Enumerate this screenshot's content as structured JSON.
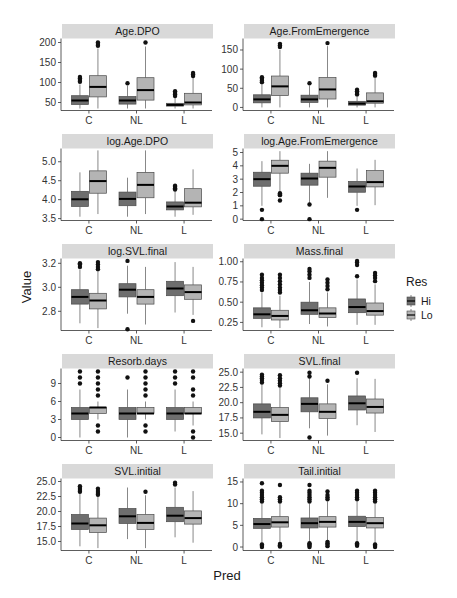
{
  "colors": {
    "hi_fill": "#6e6e6e",
    "lo_fill": "#b4b4b4",
    "box_stroke": "#4a4a4a",
    "median": "#000000",
    "whisker": "#6a6a6a",
    "outlier": "#111111",
    "strip_bg": "#d9d9d9",
    "axis": "#333333"
  },
  "chart_data": {
    "type": "boxplot",
    "layout": "facet_wrap 5 rows x 2 cols, free y scales",
    "xlabel": "Pred",
    "ylabel": "Value",
    "categories": [
      "C",
      "NL",
      "L"
    ],
    "legend": {
      "title": "Res",
      "entries": [
        "Hi",
        "Lo"
      ],
      "position": "right"
    },
    "panels": [
      {
        "title": "Age.DPO",
        "ylim": [
          30,
          210
        ],
        "yticks": [
          50,
          100,
          150,
          200
        ],
        "boxes": {
          "C": {
            "Hi": [
              35,
              45,
              55,
              67,
              95,
              [
                102,
                106,
                110,
                114
              ]
            ],
            "Lo": [
              35,
              64,
              89,
              117,
              185,
              [
                192,
                196,
                200
              ]
            ]
          },
          "NL": {
            "Hi": [
              35,
              46,
              55,
              65,
              92,
              [
                98
              ]
            ],
            "Lo": [
              35,
              56,
              81,
              112,
              190,
              [
                200
              ]
            ]
          },
          "L": {
            "Hi": [
              35,
              41,
              44,
              48,
              62,
              [
                66,
                70,
                74,
                78
              ]
            ],
            "Lo": [
              35,
              44,
              50,
              73,
              112,
              [
                116,
                120,
                124
              ]
            ]
          }
        }
      },
      {
        "title": "Age.FromEmergence",
        "ylim": [
          -8,
          180
        ],
        "yticks": [
          0,
          50,
          100,
          150
        ],
        "boxes": {
          "C": {
            "Hi": [
              0,
              12,
              21,
              33,
              62,
              [
                66,
                70,
                75,
                79
              ]
            ],
            "Lo": [
              0,
              31,
              55,
              82,
              150,
              [
                158,
                162,
                166
              ]
            ]
          },
          "NL": {
            "Hi": [
              0,
              13,
              21,
              32,
              57,
              [
                63
              ]
            ],
            "Lo": [
              0,
              22,
              47,
              78,
              160,
              [
                168
              ]
            ]
          },
          "L": {
            "Hi": [
              0,
              6,
              10,
              16,
              30,
              [
                34,
                38,
                42,
                46
              ]
            ],
            "Lo": [
              0,
              11,
              16,
              38,
              80,
              [
                83,
                87,
                90
              ]
            ]
          }
        }
      },
      {
        "title": "log.Age.DPO",
        "ylim": [
          3.45,
          5.35
        ],
        "yticks": [
          3.5,
          4.0,
          4.5,
          5.0
        ],
        "boxes": {
          "C": {
            "Hi": [
              3.55,
              3.82,
              4.01,
              4.22,
              4.72,
              []
            ],
            "Lo": [
              3.62,
              4.17,
              4.49,
              4.76,
              5.3,
              []
            ]
          },
          "NL": {
            "Hi": [
              3.55,
              3.84,
              4.02,
              4.2,
              4.58,
              []
            ],
            "Lo": [
              3.62,
              4.05,
              4.39,
              4.72,
              5.3,
              []
            ]
          },
          "L": {
            "Hi": [
              3.55,
              3.73,
              3.82,
              3.94,
              4.22,
              [
                4.27,
                4.3,
                4.34,
                4.37
              ]
            ],
            "Lo": [
              3.6,
              3.81,
              3.92,
              4.29,
              4.8,
              []
            ]
          }
        }
      },
      {
        "title": "log.Age.FromEmergence",
        "ylim": [
          -0.1,
          5.3
        ],
        "yticks": [
          0,
          1,
          2,
          3,
          4,
          5
        ],
        "boxes": {
          "C": {
            "Hi": [
              1.0,
              2.47,
              3.0,
              3.52,
              4.35,
              [
                0.7,
                0.0
              ]
            ],
            "Lo": [
              2.0,
              3.45,
              4.0,
              4.42,
              5.1,
              [
                1.8,
                1.95,
                1.85,
                1.4
              ]
            ]
          },
          "NL": {
            "Hi": [
              1.2,
              2.55,
              3.05,
              3.45,
              4.15,
              [
                1.1,
                0.0
              ]
            ],
            "Lo": [
              1.6,
              3.15,
              3.85,
              4.35,
              5.1,
              []
            ]
          },
          "L": {
            "Hi": [
              1.0,
              2.02,
              2.45,
              2.83,
              3.8,
              [
                0.7
              ]
            ],
            "Lo": [
              1.05,
              2.42,
              2.78,
              3.65,
              4.45,
              []
            ]
          }
        }
      },
      {
        "title": "log.SVL.final",
        "ylim": [
          2.64,
          3.24
        ],
        "yticks": [
          2.8,
          3.0,
          3.2
        ],
        "boxes": {
          "C": {
            "Hi": [
              2.7,
              2.86,
              2.92,
              2.98,
              3.15,
              [
                3.17,
                3.19,
                3.2
              ]
            ],
            "Lo": [
              2.66,
              2.82,
              2.89,
              2.95,
              3.13,
              [
                3.15,
                3.17,
                3.19,
                3.21
              ]
            ]
          },
          "NL": {
            "Hi": [
              2.78,
              2.92,
              2.98,
              3.03,
              3.18,
              [
                2.65,
                3.22
              ]
            ],
            "Lo": [
              2.69,
              2.86,
              2.92,
              2.98,
              3.17,
              []
            ]
          },
          "L": {
            "Hi": [
              2.79,
              2.93,
              2.99,
              3.05,
              3.21,
              []
            ],
            "Lo": [
              2.77,
              2.9,
              2.96,
              3.02,
              3.17,
              [
                2.72
              ]
            ]
          }
        }
      },
      {
        "title": "Mass.final",
        "ylim": [
          0.15,
          1.04
        ],
        "yticks": [
          0.25,
          0.5,
          0.75,
          1.0
        ],
        "boxes": {
          "C": {
            "Hi": [
              0.19,
              0.3,
              0.35,
              0.43,
              0.62,
              [
                0.65,
                0.68,
                0.71,
                0.74,
                0.77,
                0.8,
                0.84
              ]
            ],
            "Lo": [
              0.18,
              0.28,
              0.33,
              0.4,
              0.58,
              [
                0.62,
                0.65,
                0.68,
                0.72,
                0.76,
                0.8,
                0.84
              ]
            ]
          },
          "NL": {
            "Hi": [
              0.23,
              0.35,
              0.4,
              0.5,
              0.75,
              [
                0.8,
                0.84,
                0.88,
                0.91
              ]
            ],
            "Lo": [
              0.2,
              0.31,
              0.36,
              0.43,
              0.62,
              [
                0.66,
                0.7,
                0.74,
                0.78
              ]
            ]
          },
          "L": {
            "Hi": [
              0.22,
              0.37,
              0.44,
              0.54,
              0.78,
              [
                0.82,
                0.96,
                0.99,
                1.01
              ]
            ],
            "Lo": [
              0.22,
              0.34,
              0.39,
              0.49,
              0.72,
              [
                0.76,
                0.8,
                0.83,
                0.86
              ]
            ]
          }
        }
      },
      {
        "title": "Resorb.days",
        "ylim": [
          -0.5,
          11.5
        ],
        "yticks": [
          0,
          3,
          6,
          9
        ],
        "boxes": {
          "C": {
            "Hi": [
              0,
              3,
              4,
              5,
              8,
              [
                9,
                10,
                11
              ]
            ],
            "Lo": [
              3,
              4,
              5,
              5,
              6,
              [
                1,
                2,
                7,
                8,
                9,
                10,
                11
              ]
            ]
          },
          "NL": {
            "Hi": [
              0,
              3,
              4,
              5,
              8,
              [
                10
              ]
            ],
            "Lo": [
              3,
              4,
              4,
              5,
              6,
              [
                1,
                2,
                7,
                8,
                9,
                10,
                11
              ]
            ]
          },
          "L": {
            "Hi": [
              1,
              3,
              4,
              5,
              8,
              [
                9,
                10,
                11
              ]
            ],
            "Lo": [
              2,
              4,
              4,
              5,
              6,
              [
                0,
                1,
                7,
                8,
                10,
                11
              ]
            ]
          }
        }
      },
      {
        "title": "SVL.final",
        "ylim": [
          13.8,
          25.6
        ],
        "yticks": [
          15.0,
          17.5,
          20.0,
          22.5,
          25.0
        ],
        "boxes": {
          "C": {
            "Hi": [
              14.8,
              17.5,
              18.5,
              19.8,
              23.0,
              [
                23.3,
                23.7,
                24.0,
                24.3,
                24.6
              ]
            ],
            "Lo": [
              14.2,
              16.9,
              18.0,
              19.2,
              22.5,
              [
                22.8,
                23.2,
                23.6,
                24.0,
                24.5
              ]
            ]
          },
          "NL": {
            "Hi": [
              15.8,
              18.5,
              19.8,
              20.8,
              24.0,
              [
                14.3,
                24.3,
                24.9
              ]
            ],
            "Lo": [
              14.6,
              17.4,
              18.5,
              19.8,
              23.0,
              [
                23.6
              ]
            ]
          },
          "L": {
            "Hi": [
              16.3,
              18.8,
              19.9,
              21.1,
              24.0,
              [
                24.9
              ]
            ],
            "Lo": [
              15.2,
              18.3,
              19.3,
              20.6,
              23.9,
              []
            ]
          }
        }
      },
      {
        "title": "SVL.initial",
        "ylim": [
          13.5,
          25.5
        ],
        "yticks": [
          15.0,
          17.5,
          20.0,
          22.5,
          25.0
        ],
        "boxes": {
          "C": {
            "Hi": [
              14.2,
              17.0,
              18.0,
              19.5,
              23.0,
              [
                23.3,
                23.6,
                23.9,
                24.2
              ]
            ],
            "Lo": [
              13.9,
              16.5,
              17.7,
              18.9,
              22.5,
              [
                22.8,
                23.1,
                23.4,
                23.8
              ]
            ]
          },
          "NL": {
            "Hi": [
              15.4,
              18.0,
              19.2,
              20.5,
              24.0,
              []
            ],
            "Lo": [
              13.9,
              17.0,
              18.1,
              19.5,
              22.7,
              [
                23.3
              ]
            ]
          },
          "L": {
            "Hi": [
              15.7,
              18.3,
              19.3,
              20.7,
              24.0,
              [
                24.5,
                24.8
              ]
            ],
            "Lo": [
              14.8,
              17.9,
              18.9,
              20.1,
              23.4,
              []
            ]
          }
        }
      },
      {
        "title": "Tail.initial",
        "ylim": [
          -0.8,
          15.8
        ],
        "yticks": [
          0,
          5,
          10,
          15
        ],
        "boxes": {
          "C": {
            "Hi": [
              0.8,
              4.3,
              5.3,
              6.6,
              10.0,
              [
                0.0,
                0.3,
                0.6,
                10.5,
                11.0,
                11.5,
                12.0,
                12.5,
                13.0,
                14.7
              ]
            ],
            "Lo": [
              1.0,
              4.6,
              5.7,
              7.0,
              10.0,
              [
                0.1,
                0.4,
                0.7,
                10.5,
                11.0,
                11.5,
                14.3
              ]
            ]
          },
          "NL": {
            "Hi": [
              1.0,
              4.4,
              5.5,
              6.7,
              10.0,
              [
                0.0,
                0.3,
                0.6,
                0.9,
                10.5,
                11.0,
                11.5,
                12.0,
                12.5,
                13.0,
                14.3
              ]
            ],
            "Lo": [
              1.2,
              4.6,
              5.8,
              7.0,
              10.5,
              [
                0.2,
                0.5,
                0.9,
                1.2,
                11.0,
                11.5,
                12.0,
                12.8
              ]
            ]
          },
          "L": {
            "Hi": [
              1.0,
              4.7,
              5.8,
              7.1,
              10.5,
              [
                0.3,
                0.6,
                0.9,
                11.0,
                11.5,
                12.0,
                12.5,
                13.0
              ]
            ],
            "Lo": [
              0.8,
              4.4,
              5.5,
              6.8,
              10.0,
              [
                0.0,
                0.3,
                0.6,
                10.5,
                11.0,
                11.5,
                12.0,
                12.5,
                13.0
              ]
            ]
          }
        }
      }
    ]
  }
}
